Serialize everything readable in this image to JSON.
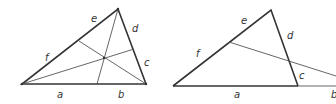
{
  "colors": {
    "stroke": "#333333",
    "thin": "#555555",
    "background": "#ffffff"
  },
  "figure_left": {
    "description": "Triangle with three concurrent cevians (Ceva's theorem)",
    "vertices": {
      "A": [
        22,
        84
      ],
      "B": [
        146,
        84
      ],
      "C": [
        118,
        9
      ]
    },
    "cevian_feet": {
      "base": [
        97,
        84
      ],
      "left_side": [
        79,
        41
      ],
      "right_side": [
        134,
        49
      ]
    },
    "concurrency_point": [
      104,
      58
    ],
    "labels": {
      "a": "a",
      "b": "b",
      "c": "c",
      "d": "d",
      "e": "e",
      "f": "f"
    }
  },
  "figure_right": {
    "description": "Triangle cut by a transversal line (Menelaus' theorem)",
    "vertices": {
      "A": [
        173,
        86
      ],
      "B": [
        298,
        86
      ],
      "C": [
        271,
        10
      ]
    },
    "transversal_points": {
      "left_side": [
        229,
        42
      ],
      "right_side": [
        289,
        61
      ],
      "base_extension": [
        336,
        76
      ]
    },
    "labels": {
      "a": "a",
      "b": "b",
      "c": "c",
      "d": "d",
      "e": "e",
      "f": "f"
    }
  }
}
